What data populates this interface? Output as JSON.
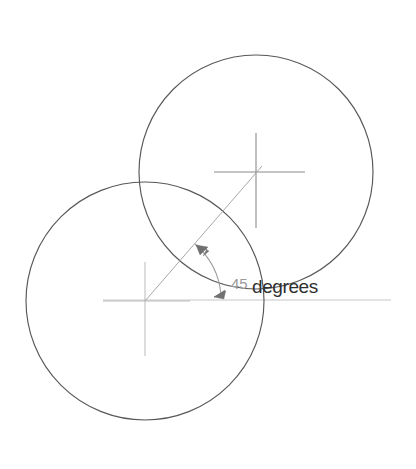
{
  "drawing": {
    "title": "Angular dimension between two circle centers",
    "background_color": "#ffffff",
    "width": 416,
    "height": 469,
    "dimension": {
      "value": "45",
      "unit_label": "degrees",
      "full_label": "45 degrees",
      "text_color": "#2f2f2f",
      "text_x": 231,
      "text_y": 291
    },
    "circles": [
      {
        "name": "upper-right-circle",
        "cx": 256,
        "cy": 172,
        "r": 117,
        "stroke_color": "#585858"
      },
      {
        "name": "lower-left-circle",
        "cx": 145,
        "cy": 301,
        "r": 119,
        "stroke_color": "#585858"
      }
    ],
    "center_marks": [
      {
        "name": "upper-circle-center-mark",
        "cx": 256,
        "cy": 172,
        "h_x1": 214,
        "h_x2": 305,
        "v_y1": 133,
        "v_y2": 228,
        "stroke_color": "#8a8a8a"
      },
      {
        "name": "lower-circle-center-mark",
        "cx": 145,
        "cy": 301,
        "h_x1": 103,
        "h_x2": 190,
        "v_y1": 262,
        "v_y2": 356,
        "stroke_color": "#b9b9b9"
      }
    ],
    "datum_line": {
      "name": "horizontal-datum-line",
      "x1": 103,
      "y1": 300,
      "x2": 391,
      "y2": 300,
      "stroke_color": "#c6c6c6"
    },
    "leader_line": {
      "name": "center-to-center-leader",
      "x1": 145,
      "y1": 301,
      "x2": 262,
      "y2": 166,
      "stroke_color": "#a8a8a8"
    },
    "angle_arc": {
      "name": "angular-dimension-arc",
      "center_x": 145,
      "center_y": 301,
      "radius": 76,
      "start_angle_deg": 49,
      "end_angle_deg": 3,
      "stroke_color": "#9d9d9d"
    },
    "arrowheads": [
      {
        "name": "arc-arrowhead-upper",
        "x": 200,
        "y": 249,
        "direction_deg": 228,
        "fill_color": "#707070"
      },
      {
        "name": "arc-arrowhead-lower",
        "x": 220,
        "y": 294,
        "direction_deg": 196,
        "fill_color": "#707070"
      }
    ]
  }
}
